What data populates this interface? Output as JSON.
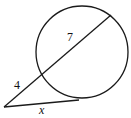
{
  "diagram": {
    "type": "circle-secant-tangent",
    "stroke_color": "#1a1a1a",
    "background": "#ffffff",
    "circle": {
      "cx": 82,
      "cy": 52,
      "r": 46
    },
    "external_point": {
      "x": 4,
      "y": 107
    },
    "secant": {
      "entry": {
        "x": 42,
        "y": 75
      },
      "exit": {
        "x": 111,
        "y": 15
      }
    },
    "tangent": {
      "point": {
        "x": 79,
        "y": 100
      }
    },
    "labels": {
      "external_segment": "4",
      "internal_segment": "7",
      "tangent_segment": "x"
    }
  }
}
